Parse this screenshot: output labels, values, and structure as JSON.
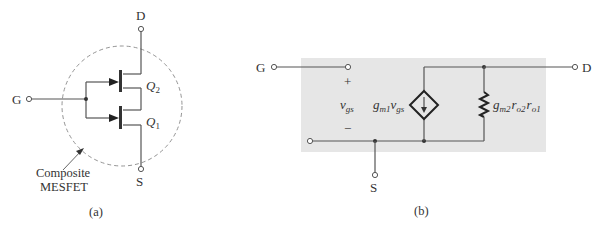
{
  "figure_a": {
    "caption": "(a)",
    "terminals": {
      "drain": "D",
      "gate": "G",
      "source": "S"
    },
    "transistors": [
      {
        "label": "Q",
        "sub": "2"
      },
      {
        "label": "Q",
        "sub": "1"
      }
    ],
    "annotation": {
      "line1": "Composite",
      "line2": "MESFET"
    }
  },
  "figure_b": {
    "caption": "(b)",
    "terminals": {
      "gate": "G",
      "drain": "D",
      "source": "S"
    },
    "polarity": {
      "plus": "+",
      "minus": "−"
    },
    "vgs": {
      "main": "v",
      "sub": "gs"
    },
    "current_source": {
      "g": "g",
      "gsub": "m1",
      "v": "v",
      "vsub": "gs"
    },
    "resistor": {
      "g": "g",
      "gsub": "m2",
      "r1": "r",
      "r1sub": "o2",
      "r2": "r",
      "r2sub": "o1"
    },
    "colors": {
      "shade": "#e6e6e6",
      "line": "#555555"
    }
  }
}
